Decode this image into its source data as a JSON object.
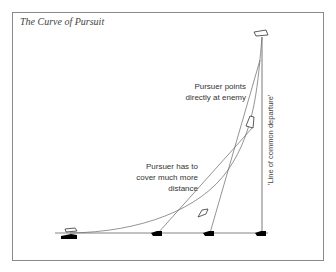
{
  "title": "The Curve of Pursuit",
  "labels": {
    "pursuer_points": [
      "Pursuer points",
      "directly at enemy"
    ],
    "pursuer_distance": [
      "Pursuer has to",
      "cover much more",
      "distance"
    ],
    "departure_line": "'Line of common departure'"
  },
  "colors": {
    "line": "#555555",
    "frame": "#8a8a8a",
    "boat_fill": "#000000"
  }
}
